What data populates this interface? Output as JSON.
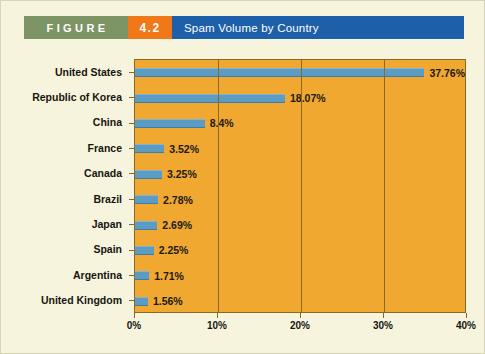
{
  "header": {
    "figure_label": "FIGURE",
    "figure_number": "4.2",
    "title": "Spam Volume by Country",
    "green": "#7d9465",
    "orange": "#f07818",
    "blue": "#1d5fa8"
  },
  "chart_data": {
    "type": "bar",
    "orientation": "horizontal",
    "title": "Spam Volume by Country",
    "xlabel": "",
    "ylabel": "",
    "xlim": [
      0,
      40
    ],
    "grid": true,
    "legend": false,
    "bar_color": "#5b9bc4",
    "plot_background": "#f0a830",
    "xticks": [
      "0%",
      "10%",
      "20%",
      "30%",
      "40%"
    ],
    "xtick_values": [
      0,
      10,
      20,
      30,
      40
    ],
    "categories": [
      "United States",
      "Republic of Korea",
      "China",
      "France",
      "Canada",
      "Brazil",
      "Japan",
      "Spain",
      "Argentina",
      "United Kingdom"
    ],
    "values": [
      37.76,
      18.07,
      8.4,
      3.52,
      3.25,
      2.78,
      2.69,
      2.25,
      1.71,
      1.56
    ],
    "data_labels": [
      "37.76%",
      "18.07%",
      "8.4%",
      "3.52%",
      "3.25%",
      "2.78%",
      "2.69%",
      "2.25%",
      "1.71%",
      "1.56%"
    ]
  }
}
